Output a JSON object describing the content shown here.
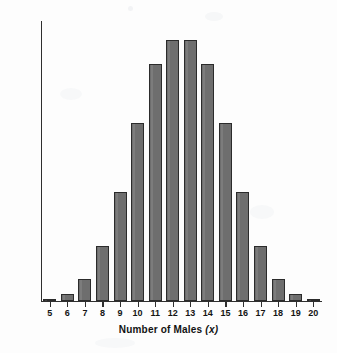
{
  "chart_data": {
    "type": "bar",
    "title": "",
    "xlabel": "Number of Males (x)",
    "xlabel_main": "Number of Males",
    "xlabel_variable": "(x)",
    "ylabel": "Probability",
    "categories": [
      "5",
      "6",
      "7",
      "8",
      "9",
      "10",
      "11",
      "12",
      "13",
      "14",
      "15",
      "16",
      "17",
      "18",
      "19",
      "20"
    ],
    "values": [
      0.0011,
      0.0046,
      0.0148,
      0.037,
      0.0739,
      0.1201,
      0.1602,
      0.1762,
      0.1762,
      0.1602,
      0.1201,
      0.0739,
      0.037,
      0.0148,
      0.0046,
      0.0011
    ],
    "bar_pixel_heights": [
      3,
      9,
      24,
      49,
      105,
      175,
      228,
      261,
      261,
      228,
      175,
      105,
      49,
      24,
      9,
      3
    ],
    "ylim": [
      0,
      0.189
    ],
    "xlim": [
      4.5,
      20.5
    ],
    "grid": false,
    "legend": false,
    "legend_position": "none",
    "bar_color": "#6e6e6e",
    "bar_edge_color": "#2b2b2b",
    "axis_color": "#2f2f2f",
    "background_color": "#ffffff",
    "y_tick_labels": [],
    "annotations": []
  }
}
